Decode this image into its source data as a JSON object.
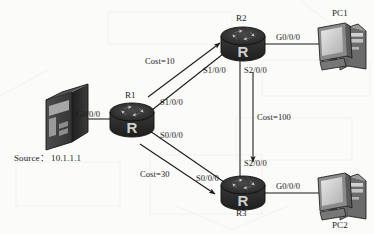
{
  "diagram": {
    "type": "network-topology",
    "background_color": "#fbfbf9",
    "stroke_color": "#1a1a1a",
    "device_fill_dark": "#2b2b2b",
    "device_fill_mid": "#6e6e6e",
    "device_fill_light": "#c9c9c9",
    "nodes": [
      {
        "id": "server",
        "label": "",
        "kind": "server-tower",
        "x": 42,
        "y": 92,
        "w": 46,
        "h": 58
      },
      {
        "id": "r1",
        "label": "R1",
        "kind": "router",
        "x": 110,
        "y": 103,
        "w": 44,
        "h": 34
      },
      {
        "id": "r2",
        "label": "R2",
        "kind": "router",
        "x": 221,
        "y": 27,
        "w": 44,
        "h": 34
      },
      {
        "id": "r3",
        "label": "R3",
        "kind": "router",
        "x": 221,
        "y": 176,
        "w": 44,
        "h": 34
      },
      {
        "id": "pc1",
        "label": "PC1",
        "kind": "desktop-pc",
        "x": 316,
        "y": 22,
        "w": 52,
        "h": 48
      },
      {
        "id": "pc2",
        "label": "PC2",
        "kind": "desktop-pc",
        "x": 316,
        "y": 172,
        "w": 52,
        "h": 48
      }
    ],
    "node_labels": {
      "r1": "R1",
      "r2": "R2",
      "r3": "R3",
      "pc1": "PC1",
      "pc2": "PC2"
    },
    "source_label": "Source： 10.1.1.1",
    "interfaces": {
      "server_to_r1": "G0/0/0",
      "r1_to_r2": "S1/0/0",
      "r2_to_r1": "S1/0/0",
      "r1_to_r3": "S0/0/0",
      "r3_to_r1": "S0/0/0",
      "r2_to_r3": "S2/0/0",
      "r3_to_r2": "S2/0/0",
      "r2_to_pc1": "G0/0/0",
      "r3_to_pc2": "G0/0/0"
    },
    "costs": [
      {
        "id": "cost-r1-r2",
        "label": "Cost=10",
        "value": 10,
        "from": "R1",
        "to": "R2"
      },
      {
        "id": "cost-r2-r3",
        "label": "Cost=100",
        "value": 100,
        "from": "R2",
        "to": "R3"
      },
      {
        "id": "cost-r1-r3",
        "label": "Cost=30",
        "value": 30,
        "from": "R1",
        "to": "R3"
      }
    ],
    "links": [
      {
        "from": "server",
        "to": "r1",
        "style": "plain"
      },
      {
        "from": "r1",
        "to": "r2",
        "style": "plain"
      },
      {
        "from": "r1",
        "to": "r3",
        "style": "plain"
      },
      {
        "from": "r2",
        "to": "r3",
        "style": "plain"
      },
      {
        "from": "r2",
        "to": "pc1",
        "style": "plain"
      },
      {
        "from": "r3",
        "to": "pc2",
        "style": "plain"
      }
    ]
  }
}
